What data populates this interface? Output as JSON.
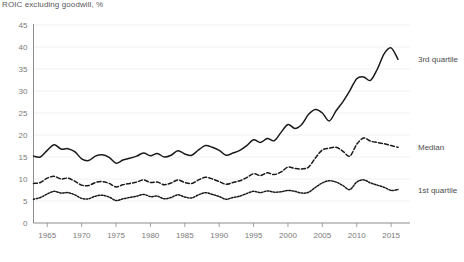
{
  "chart_data": {
    "type": "line",
    "title": "ROIC excluding goodwill, %",
    "xlabel": "",
    "ylabel": "",
    "xlim": [
      1963,
      2016
    ],
    "ylim": [
      0,
      45
    ],
    "ytick_labels": [
      "0",
      "5",
      "10",
      "15",
      "20",
      "25",
      "30",
      "35",
      "40",
      "45"
    ],
    "yticks": [
      0,
      5,
      10,
      15,
      20,
      25,
      30,
      35,
      40,
      45
    ],
    "xtick_labels": [
      "1965",
      "1970",
      "1975",
      "1980",
      "1985",
      "1990",
      "1995",
      "2000",
      "2005",
      "2010",
      "2015"
    ],
    "xticks": [
      1965,
      1970,
      1975,
      1980,
      1985,
      1990,
      1995,
      2000,
      2005,
      2010,
      2015
    ],
    "grid": true,
    "legend_position": "right-inline",
    "x": [
      1963,
      1964,
      1965,
      1966,
      1967,
      1968,
      1969,
      1970,
      1971,
      1972,
      1973,
      1974,
      1975,
      1976,
      1977,
      1978,
      1979,
      1980,
      1981,
      1982,
      1983,
      1984,
      1985,
      1986,
      1987,
      1988,
      1989,
      1990,
      1991,
      1992,
      1993,
      1994,
      1995,
      1996,
      1997,
      1998,
      1999,
      2000,
      2001,
      2002,
      2003,
      2004,
      2005,
      2006,
      2007,
      2008,
      2009,
      2010,
      2011,
      2012,
      2013,
      2014,
      2015,
      2016
    ],
    "series": [
      {
        "name": "3rd quartile",
        "style": "solid",
        "color": "#1a1a1a",
        "values": [
          15.2,
          15.0,
          16.5,
          17.8,
          16.8,
          16.9,
          16.2,
          14.6,
          14.2,
          15.2,
          15.5,
          14.9,
          13.6,
          14.3,
          14.7,
          15.2,
          15.9,
          15.3,
          15.8,
          15.0,
          15.4,
          16.4,
          15.7,
          15.4,
          16.6,
          17.6,
          17.2,
          16.5,
          15.4,
          15.9,
          16.5,
          17.6,
          18.9,
          18.3,
          19.2,
          18.7,
          20.6,
          22.4,
          21.5,
          22.4,
          24.7,
          25.8,
          25.0,
          23.2,
          25.5,
          27.6,
          30.1,
          32.8,
          33.2,
          32.4,
          35.0,
          38.5,
          39.8,
          37.2
        ]
      },
      {
        "name": "Median",
        "style": "dashed",
        "color": "#1a1a1a",
        "values": [
          9.0,
          9.2,
          10.2,
          10.6,
          10.0,
          10.2,
          9.5,
          8.6,
          8.5,
          9.2,
          9.4,
          9.0,
          8.2,
          8.7,
          9.0,
          9.3,
          9.8,
          9.2,
          9.3,
          8.7,
          9.1,
          9.8,
          9.2,
          9.0,
          9.8,
          10.4,
          10.0,
          9.4,
          8.8,
          9.2,
          9.6,
          10.3,
          11.2,
          10.8,
          11.4,
          11.0,
          11.6,
          12.7,
          12.4,
          12.3,
          12.7,
          14.8,
          16.6,
          17.0,
          17.2,
          16.3,
          15.2,
          17.9,
          19.3,
          18.6,
          18.3,
          18.0,
          17.6,
          17.2
        ]
      },
      {
        "name": "1st quartile",
        "style": "dotted",
        "color": "#1a1a1a",
        "values": [
          5.4,
          5.8,
          6.6,
          7.2,
          6.8,
          6.9,
          6.4,
          5.6,
          5.5,
          6.1,
          6.3,
          5.9,
          5.1,
          5.5,
          5.8,
          6.1,
          6.5,
          6.0,
          6.1,
          5.5,
          5.8,
          6.4,
          5.9,
          5.7,
          6.4,
          6.9,
          6.5,
          6.0,
          5.4,
          5.8,
          6.1,
          6.7,
          7.2,
          6.9,
          7.3,
          7.0,
          7.1,
          7.4,
          7.2,
          6.8,
          7.0,
          8.1,
          9.1,
          9.6,
          9.3,
          8.5,
          7.6,
          9.3,
          9.8,
          9.1,
          8.6,
          8.1,
          7.4,
          7.6
        ]
      }
    ]
  }
}
